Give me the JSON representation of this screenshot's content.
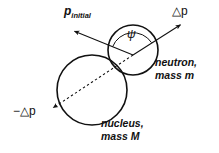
{
  "diagram": {
    "background_color": "#ffffff",
    "stroke_color": "#111111",
    "labels": {
      "p_initial_symbol": "p",
      "p_initial_subscript": "initial",
      "delta_p": "△p",
      "neg_delta_p": "−△p",
      "angle_symbol": "ψ",
      "neutron_line1": "neutron,",
      "neutron_line2": "mass m",
      "nucleus_line1": "nucleus,",
      "nucleus_line2": "mass M"
    },
    "shapes": {
      "neutron_circle": {
        "cx": 133,
        "cy": 50,
        "r": 25,
        "label": "neutron"
      },
      "nucleus_circle": {
        "cx": 92,
        "cy": 90,
        "r": 35,
        "label": "nucleus"
      },
      "vertex": {
        "x": 133,
        "y": 55
      },
      "p_initial_arrow": {
        "x1": 133,
        "y1": 55,
        "x2": 72,
        "y2": 30,
        "style": "solid",
        "arrowhead": "end"
      },
      "delta_p_arrow": {
        "x1": 133,
        "y1": 55,
        "x2": 183,
        "y2": 23,
        "style": "solid",
        "arrowhead": "end"
      },
      "neg_delta_p_arrow": {
        "x1": 133,
        "y1": 55,
        "x2": 50,
        "y2": 110,
        "style": "dashed",
        "arrowhead": "end"
      },
      "angle_arc": {
        "cx": 133,
        "cy": 55,
        "r": 22,
        "from_deg": 202,
        "to_deg": 327
      }
    }
  }
}
